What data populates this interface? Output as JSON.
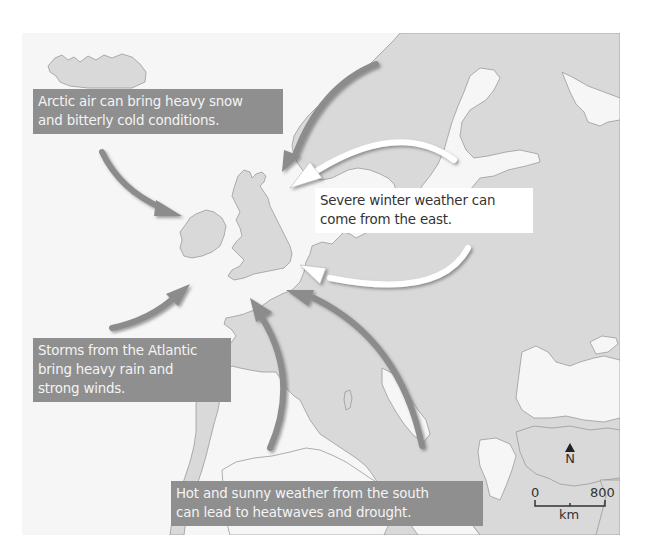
{
  "map": {
    "title": "Sources of extreme weather affecting the British Isles",
    "colors": {
      "sea": "#f6f6f6",
      "land": "#d9d9d9",
      "coast": "#9a9a9a",
      "dark_arrow": "#8c8c8c",
      "light_arrow": "#ffffff",
      "label_dark_bg": "#8f8f8f",
      "label_dark_text": "#f4f4f4",
      "label_light_bg": "#ffffff",
      "label_light_text": "#333333"
    }
  },
  "labels": {
    "arctic": {
      "line1": "Arctic air can bring heavy snow",
      "line2": "and bitterly cold conditions."
    },
    "east": {
      "line1": "Severe winter weather can",
      "line2": "come from the east."
    },
    "atlantic": {
      "line1": "Storms from the Atlantic",
      "line2": "bring heavy rain and",
      "line3": "strong winds."
    },
    "south": {
      "line1": "Hot and sunny weather from the south",
      "line2": "can lead to heatwaves and drought."
    }
  },
  "arrows": [
    {
      "name": "arctic-arrow-northwest",
      "style": "dark",
      "direction": "from north-west toward Ireland"
    },
    {
      "name": "arctic-arrow-north",
      "style": "dark",
      "direction": "from Norway toward North Sea"
    },
    {
      "name": "east-arrow-scandinavia",
      "style": "light",
      "direction": "from Sweden toward Scotland"
    },
    {
      "name": "east-arrow-continent",
      "style": "light",
      "direction": "from Central Europe toward English Channel"
    },
    {
      "name": "atlantic-arrow",
      "style": "dark",
      "direction": "from Atlantic toward south-west Ireland"
    },
    {
      "name": "south-arrow-iberia",
      "style": "dark",
      "direction": "from Iberia toward Brittany"
    },
    {
      "name": "south-arrow-mediterranean",
      "style": "dark",
      "direction": "from Italy toward English Channel"
    }
  ],
  "compass": {
    "label": "N"
  },
  "scale_bar": {
    "start": "0",
    "end": "800",
    "unit": "km"
  }
}
